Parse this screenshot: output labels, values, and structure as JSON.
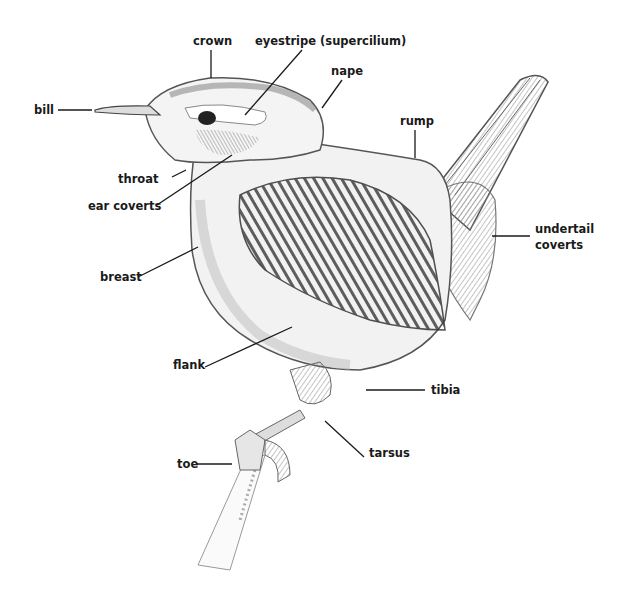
{
  "diagram": {
    "colors": {
      "ink": "#1a1a1a",
      "pencil_dark": "#555555",
      "pencil_mid": "#8a8a8a",
      "pencil_light": "#c8c8c8",
      "background": "#ffffff"
    },
    "labels": {
      "crown": "crown",
      "eyestripe": "eyestripe (supercilium)",
      "nape": "nape",
      "bill": "bill",
      "rump": "rump",
      "throat": "throat",
      "ear_coverts": "ear coverts",
      "undertail_1": "undertail",
      "undertail_2": "coverts",
      "breast": "breast",
      "flank": "flank",
      "tibia": "tibia",
      "tarsus": "tarsus",
      "toe": "toe"
    }
  }
}
